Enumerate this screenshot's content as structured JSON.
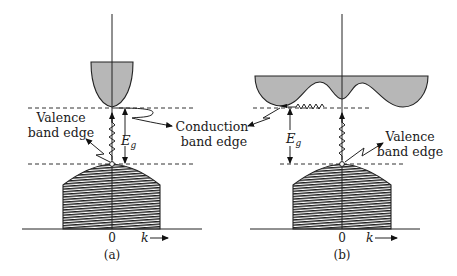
{
  "figure": {
    "panels": [
      {
        "id": "a",
        "caption": "(a)",
        "axis_origin_label": "0",
        "axis_k_label": "k",
        "energy_gap_label": "E",
        "energy_gap_subscript": "g",
        "labels": {
          "valence_line1": "Valence",
          "valence_line2": "band edge",
          "conduction_line1": "Conduction",
          "conduction_line2": "band edge"
        },
        "transition": "direct"
      },
      {
        "id": "b",
        "caption": "(b)",
        "axis_origin_label": "0",
        "axis_k_label": "k",
        "energy_gap_label": "E",
        "energy_gap_subscript": "g",
        "labels": {
          "valence_line1": "Valence",
          "valence_line2": "band edge"
        },
        "transition": "indirect"
      }
    ],
    "colors": {
      "conduction_band_fill": "#b7b7b7",
      "valence_band_hatch": "#222222",
      "line": "#222222",
      "background": "#ffffff"
    }
  }
}
